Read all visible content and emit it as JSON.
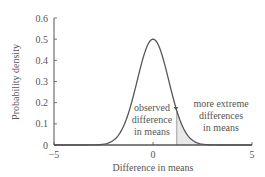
{
  "chart_data": {
    "type": "line",
    "title": "",
    "xlabel": "Difference in means",
    "ylabel": "Probability density",
    "xlim": [
      -5,
      5
    ],
    "ylim": [
      0,
      0.6
    ],
    "x_ticks": [
      "−5",
      "0",
      "5"
    ],
    "x_tick_values": [
      -5,
      0,
      5
    ],
    "y_ticks": [
      "0",
      "0.1",
      "0.2",
      "0.3",
      "0.4",
      "0.5",
      "0.6"
    ],
    "y_tick_values": [
      0,
      0.1,
      0.2,
      0.3,
      0.4,
      0.5,
      0.6
    ],
    "grid": false,
    "legend": null,
    "series": [
      {
        "name": "Sampling distribution of difference in means",
        "distribution": "normal",
        "mean": 0,
        "sd": 0.8,
        "peak": 0.5,
        "x": [
          -5,
          -4,
          -3,
          -2.5,
          -2,
          -1.5,
          -1,
          -0.5,
          0,
          0.5,
          1,
          1.2,
          1.5,
          2,
          2.5,
          3,
          4,
          5
        ],
        "values": [
          0.0,
          0.0,
          0.0002,
          0.0019,
          0.0219,
          0.086,
          0.229,
          0.412,
          0.499,
          0.412,
          0.229,
          0.162,
          0.086,
          0.022,
          0.0019,
          0.0002,
          0.0,
          0.0
        ]
      }
    ],
    "shaded_region": {
      "from": 1.2,
      "to": 5,
      "label": "more extreme differences in means"
    },
    "annotations": [
      {
        "text": "observed difference in means",
        "x": 1.2,
        "lines": [
          "observed",
          "difference",
          "in means"
        ]
      },
      {
        "text": "more extreme differences in means",
        "lines": [
          "more extreme",
          "differences",
          "in means"
        ]
      }
    ],
    "colors": {
      "curve": "#555555",
      "shade": "#e6e6e6",
      "axis": "#555555",
      "text": "#555555"
    }
  }
}
